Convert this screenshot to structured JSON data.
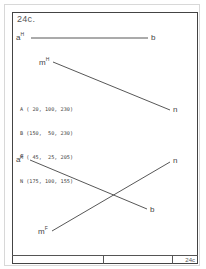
{
  "figure": {
    "title": "24c.",
    "footer_label": "24c"
  },
  "top_view": {
    "labels": {
      "a": "a",
      "a_sup": "H",
      "b": "b",
      "m": "m",
      "m_sup": "H",
      "n": "n"
    },
    "segments": [
      {
        "name": "ab-horizontal",
        "x1": 31,
        "y1": 38,
        "x2": 148,
        "y2": 38
      },
      {
        "name": "mn-horizontal",
        "x1": 53,
        "y1": 62,
        "x2": 170,
        "y2": 110
      }
    ]
  },
  "coordinates": {
    "lines": [
      "A ( 20, 100, 230)",
      "B (150,  50, 230)",
      "M ( 45,  25, 205)",
      "N (175, 100, 155)"
    ]
  },
  "front_view": {
    "labels": {
      "a": "a",
      "a_sup": "F",
      "b": "b",
      "m": "m",
      "m_sup": "F",
      "n": "n"
    },
    "segments": [
      {
        "name": "ab-frontal",
        "x1": 30,
        "y1": 160,
        "x2": 147,
        "y2": 209
      },
      {
        "name": "mn-frontal",
        "x1": 52,
        "y1": 231,
        "x2": 170,
        "y2": 162
      }
    ]
  },
  "colors": {
    "line": "#444444",
    "frame": "#444444"
  }
}
